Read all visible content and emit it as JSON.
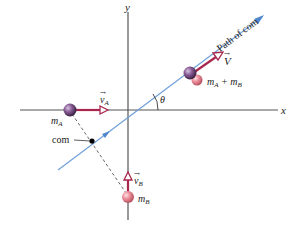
{
  "diagram": {
    "axes": {
      "x_label": "x",
      "y_label": "y"
    },
    "labels": {
      "path_of_com": "Path of com",
      "com": "com",
      "theta": "θ",
      "m_A": "m",
      "m_A_sub": "A",
      "m_B": "m",
      "m_B_sub": "B",
      "combined_m1": "m",
      "combined_sub1": "A",
      "combined_plus": " + m",
      "combined_sub2": "B",
      "v_A": "v",
      "v_A_sub": "A",
      "v_B": "v",
      "v_B_sub": "B",
      "V": "V"
    },
    "colors": {
      "axis": "#555555",
      "path_line": "#6f9fd8",
      "velocity_arrow": "#a8274f",
      "ball_A": "#7a4f86",
      "ball_B": "#e07f8c",
      "dashed": "#555555",
      "com_dot": "#000000"
    }
  }
}
